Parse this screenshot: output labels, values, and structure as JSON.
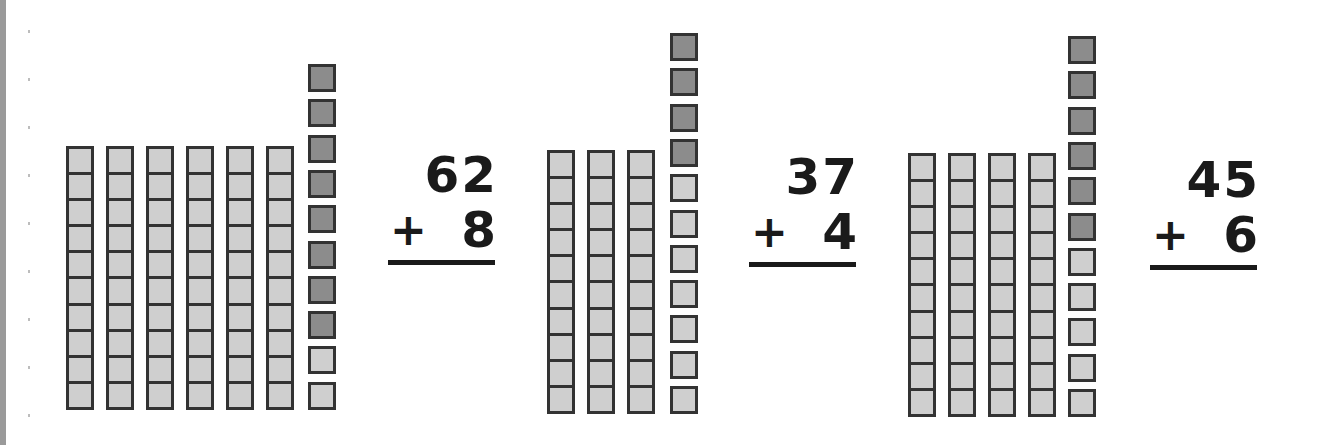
{
  "worksheet": {
    "topic": "Two-digit plus one-digit addition with base-ten blocks",
    "colors": {
      "light_cube": "#cfcfcf",
      "dark_cube": "#8c8c8c",
      "outline": "#333333",
      "text": "#1a1a1a"
    },
    "problems": [
      {
        "id": "p1",
        "top": "62",
        "operator": "+",
        "addend": "8",
        "tens_rods": 6,
        "unit_cubes_light": 2,
        "unit_cubes_dark": 8,
        "layout": {
          "rods_x": 66,
          "rods_y": 146,
          "units_x": 308,
          "units_top": 64,
          "eq_x": 388,
          "eq_y": 150
        }
      },
      {
        "id": "p2",
        "top": "37",
        "operator": "+",
        "addend": "4",
        "tens_rods": 3,
        "unit_cubes_light": 7,
        "unit_cubes_dark": 4,
        "layout": {
          "rods_x": 547,
          "rods_y": 150,
          "units_x": 670,
          "units_top": 33,
          "eq_x": 749,
          "eq_y": 152
        }
      },
      {
        "id": "p3",
        "top": "45",
        "operator": "+",
        "addend": "6",
        "tens_rods": 4,
        "unit_cubes_light": 5,
        "unit_cubes_dark": 6,
        "layout": {
          "rods_x": 908,
          "rods_y": 153,
          "units_x": 1068,
          "units_top": 36,
          "eq_x": 1150,
          "eq_y": 155
        }
      }
    ]
  }
}
